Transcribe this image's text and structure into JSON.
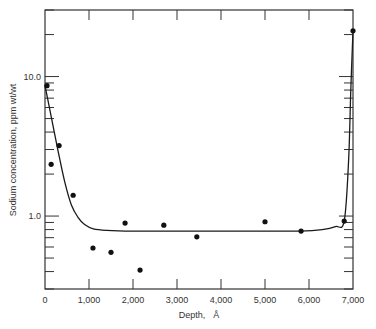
{
  "chart_data": {
    "type": "scatter",
    "title": "",
    "xlabel": "Depth, Å",
    "ylabel": "Sodium concentration, ppm wt/wt",
    "xlim": [
      0,
      7000
    ],
    "ylim": [
      0.3,
      30
    ],
    "yscale": "log",
    "grid": false,
    "legend": null,
    "x_ticks": [
      0,
      1000,
      2000,
      3000,
      4000,
      5000,
      6000,
      7000
    ],
    "x_tick_labels": [
      "0",
      "1,000",
      "2,000",
      "3,000",
      "4,000",
      "5,000",
      "6,000",
      "7,000"
    ],
    "y_tick_labels": [
      {
        "value": 10.0,
        "label": "10.0"
      },
      {
        "value": 1.0,
        "label": "1.0"
      }
    ],
    "series": [
      {
        "name": "Measured sodium",
        "kind": "points",
        "x": [
          45,
          320,
          140,
          640,
          1090,
          1500,
          1820,
          2160,
          2700,
          3450,
          5000,
          5820,
          6800,
          7000
        ],
        "y": [
          8.6,
          3.2,
          2.35,
          1.41,
          0.59,
          0.55,
          0.89,
          0.41,
          0.86,
          0.71,
          0.91,
          0.78,
          0.92,
          21.3
        ]
      },
      {
        "name": "Fitted profile",
        "kind": "line",
        "x": [
          0,
          150,
          300,
          450,
          600,
          750,
          900,
          1100,
          1400,
          2000,
          3000,
          4000,
          5000,
          5800,
          6300,
          6600,
          6800,
          6900,
          6950,
          7000
        ],
        "y": [
          8.6,
          5.0,
          2.9,
          1.75,
          1.2,
          0.98,
          0.87,
          0.81,
          0.79,
          0.78,
          0.78,
          0.78,
          0.78,
          0.78,
          0.8,
          0.84,
          0.92,
          2.5,
          8.0,
          21.3
        ]
      }
    ]
  },
  "labels": {
    "xlabel": "Depth,",
    "xunit": "Å",
    "ylabel": "Sodium concentration, ppm wt/wt"
  },
  "style": {
    "ink": "#1a1a1a",
    "background": "#ffffff"
  }
}
